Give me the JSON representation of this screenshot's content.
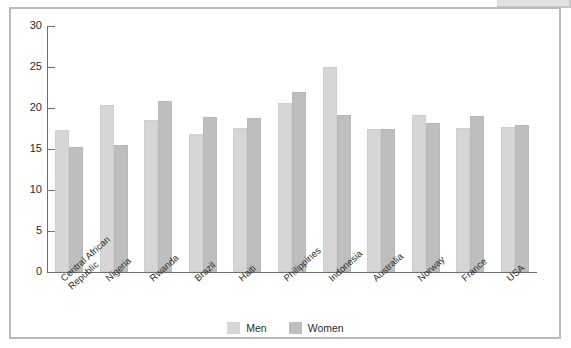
{
  "figure": {
    "frame_color": "#b9b9b9",
    "background": "#ffffff"
  },
  "legend": {
    "position": "bottom-center",
    "items": [
      {
        "label": "Men",
        "color": "#d6d6d6"
      },
      {
        "label": "Women",
        "color": "#bebebe"
      }
    ]
  },
  "chart_data": {
    "type": "bar",
    "title": "",
    "xlabel": "",
    "ylabel": "",
    "ylim": [
      0,
      30
    ],
    "yticks": [
      0,
      5,
      10,
      15,
      20,
      25,
      30
    ],
    "grid": false,
    "legend_position": "bottom-center",
    "categories": [
      "Central African Republic",
      "Nigeria",
      "Rwanda",
      "Brazil",
      "Haiti",
      "Philippines",
      "Indonesia",
      "Australia",
      "Norway",
      "France",
      "USA"
    ],
    "category_lines": [
      [
        "Central African",
        "Republic"
      ],
      [
        "Nigeria"
      ],
      [
        "Rwanda"
      ],
      [
        "Brazil"
      ],
      [
        "Haiti"
      ],
      [
        "Philippines"
      ],
      [
        "Indonesia"
      ],
      [
        "Australia"
      ],
      [
        "Norway"
      ],
      [
        "France"
      ],
      [
        "USA"
      ]
    ],
    "series": [
      {
        "name": "Men",
        "color": "#d6d6d6",
        "values": [
          17.3,
          20.4,
          18.5,
          16.8,
          17.6,
          20.6,
          25.0,
          17.5,
          19.1,
          17.6,
          17.7
        ]
      },
      {
        "name": "Women",
        "color": "#bebebe",
        "values": [
          15.3,
          15.5,
          20.9,
          18.9,
          18.8,
          21.9,
          19.1,
          17.4,
          18.2,
          19.0,
          17.9
        ]
      }
    ]
  }
}
